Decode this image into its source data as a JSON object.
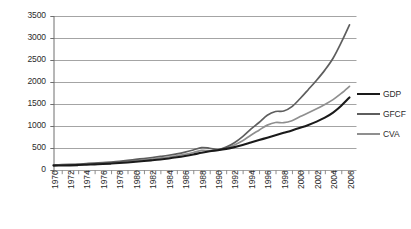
{
  "chart_data": {
    "type": "line",
    "title": "",
    "subtitle": "",
    "xlabel": "",
    "ylabel": "",
    "xlim": [
      1970,
      2006
    ],
    "ylim": [
      0,
      3500
    ],
    "ytick_step": 500,
    "grid": true,
    "grid_axis": "y",
    "legend_position": "right",
    "x": [
      1970,
      1971,
      1972,
      1973,
      1974,
      1975,
      1976,
      1977,
      1978,
      1979,
      1980,
      1981,
      1982,
      1983,
      1984,
      1985,
      1986,
      1987,
      1988,
      1989,
      1990,
      1991,
      1992,
      1993,
      1994,
      1995,
      1996,
      1997,
      1998,
      1999,
      2000,
      2001,
      2002,
      2003,
      2004,
      2005,
      2006
    ],
    "ytick_labels": [
      "0",
      "500",
      "1000",
      "1500",
      "2000",
      "2500",
      "3000",
      "3500"
    ],
    "ytick_values": [
      0,
      500,
      1000,
      1500,
      2000,
      2500,
      3000,
      3500
    ],
    "xtick_labels": [
      "1970",
      "1972",
      "1974",
      "1976",
      "1978",
      "1980",
      "1982",
      "1984",
      "1986",
      "1988",
      "1990",
      "1992",
      "1994",
      "1996",
      "1998",
      "2000",
      "2002",
      "2004",
      "2006"
    ],
    "xtick_values": [
      1970,
      1972,
      1974,
      1976,
      1978,
      1980,
      1982,
      1984,
      1986,
      1988,
      1990,
      1992,
      1994,
      1996,
      1998,
      2000,
      2002,
      2004,
      2006
    ],
    "series": [
      {
        "name": "GDP",
        "color": "#1a1a1a",
        "width": 2.1,
        "values": [
          100,
          102,
          106,
          112,
          120,
          128,
          136,
          146,
          158,
          172,
          188,
          205,
          222,
          240,
          262,
          288,
          318,
          352,
          392,
          425,
          450,
          480,
          520,
          570,
          625,
          680,
          735,
          790,
          845,
          900,
          960,
          1025,
          1100,
          1190,
          1305,
          1460,
          1650
        ]
      },
      {
        "name": "GFCF",
        "color": "#5e5e5e",
        "width": 1.7,
        "values": [
          115,
          120,
          126,
          134,
          146,
          158,
          168,
          182,
          198,
          218,
          240,
          262,
          284,
          308,
          335,
          368,
          408,
          455,
          510,
          495,
          465,
          520,
          620,
          760,
          930,
          1080,
          1245,
          1330,
          1340,
          1440,
          1625,
          1830,
          2040,
          2270,
          2540,
          2900,
          3300
        ]
      },
      {
        "name": "CVA",
        "color": "#8f8f8f",
        "width": 1.7,
        "values": [
          108,
          112,
          117,
          124,
          133,
          142,
          151,
          163,
          177,
          193,
          212,
          231,
          250,
          271,
          295,
          324,
          358,
          398,
          445,
          440,
          455,
          500,
          570,
          665,
          790,
          905,
          1020,
          1080,
          1075,
          1120,
          1215,
          1300,
          1390,
          1490,
          1600,
          1740,
          1900
        ]
      }
    ]
  },
  "legend": {
    "items": [
      {
        "label": "GDP"
      },
      {
        "label": "GFCF"
      },
      {
        "label": "CVA"
      }
    ]
  },
  "style": {
    "grid_color": "#9a9a9a",
    "axis_color": "#6e6e6e",
    "text_color": "#2b2b2b",
    "background": "#ffffff"
  }
}
